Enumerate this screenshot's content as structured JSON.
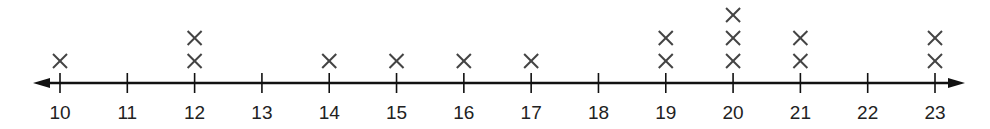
{
  "chart_data": {
    "type": "line_plot",
    "title": "",
    "xlabel": "",
    "ylabel": "",
    "marker": "X",
    "categories": [
      "10",
      "11",
      "12",
      "13",
      "14",
      "15",
      "16",
      "17",
      "18",
      "19",
      "20",
      "21",
      "22",
      "23"
    ],
    "values": [
      1,
      0,
      2,
      0,
      1,
      1,
      1,
      1,
      0,
      2,
      3,
      2,
      0,
      2
    ],
    "xlim": [
      10,
      23
    ],
    "grid": false,
    "legend": null
  },
  "colors": {
    "axis": "#111111",
    "marker": "#444444",
    "text": "#222222"
  }
}
